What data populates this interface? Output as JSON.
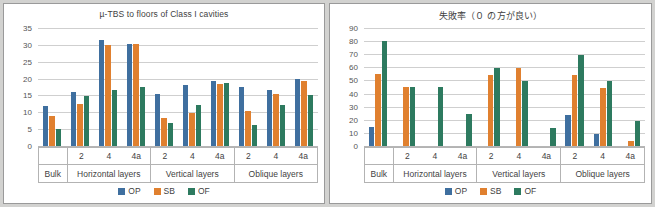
{
  "page": {
    "background": "#d2d2d0",
    "panel_background": "#ffffff"
  },
  "colors": {
    "op": "#3f6f9f",
    "sb": "#e0802f",
    "of": "#2d7a5f",
    "grid": "#cfcfcf",
    "text": "#3f3f3f"
  },
  "legend": {
    "position": "bottom-center",
    "entries": [
      {
        "label": "OP",
        "color": "#3f6f9f"
      },
      {
        "label": "SB",
        "color": "#e0802f"
      },
      {
        "label": "OF",
        "color": "#2d7a5f"
      }
    ]
  },
  "axis_groups": [
    {
      "group": "Bulk",
      "subs": [
        ""
      ]
    },
    {
      "group": "Horizontal layers",
      "subs": [
        "2",
        "4",
        "4a"
      ]
    },
    {
      "group": "Vertical layers",
      "subs": [
        "2",
        "4",
        "4a"
      ]
    },
    {
      "group": "Oblique layers",
      "subs": [
        "2",
        "4",
        "4a"
      ]
    }
  ],
  "chart_data": [
    {
      "id": "left",
      "type": "bar",
      "title": "µ-TBS to floors of Class I cavities",
      "xlabel": "",
      "ylabel": "",
      "ylim": [
        0,
        35
      ],
      "yticks": [
        0,
        5,
        10,
        15,
        20,
        25,
        30,
        35
      ],
      "ytick_labels": [
        "0",
        "5",
        "10",
        "15",
        "20",
        "25",
        "30",
        "35"
      ],
      "grid": true,
      "legend": [
        "OP",
        "SB",
        "OF"
      ],
      "categories": [
        "Bulk",
        "Horizontal layers 2",
        "Horizontal layers 4",
        "Horizontal layers 4a",
        "Vertical layers 2",
        "Vertical layers 4",
        "Vertical layers 4a",
        "Oblique layers 2",
        "Oblique layers 4",
        "Oblique layers 4a"
      ],
      "series": [
        {
          "name": "OP",
          "color": "#3f6f9f",
          "values": [
            11.8,
            16.0,
            31.5,
            30.2,
            15.5,
            18.0,
            19.2,
            17.4,
            16.6,
            19.8
          ]
        },
        {
          "name": "SB",
          "color": "#e0802f",
          "values": [
            8.8,
            12.5,
            29.9,
            30.4,
            8.4,
            9.9,
            18.4,
            10.5,
            15.3,
            19.3
          ]
        },
        {
          "name": "OF",
          "color": "#2d7a5f",
          "values": [
            5.0,
            14.9,
            16.7,
            17.4,
            6.8,
            12.2,
            18.7,
            6.3,
            12.2,
            15.2
          ]
        }
      ]
    },
    {
      "id": "right",
      "type": "bar",
      "title": "失敗率（０ の方が良い）",
      "xlabel": "",
      "ylabel": "",
      "ylim": [
        0,
        90
      ],
      "yticks": [
        0,
        10,
        20,
        30,
        40,
        50,
        60,
        70,
        80,
        90
      ],
      "ytick_labels": [
        "0",
        "10",
        "20",
        "30",
        "40",
        "50",
        "60",
        "70",
        "80",
        "90"
      ],
      "grid": true,
      "legend": [
        "OP",
        "SB",
        "OF"
      ],
      "categories": [
        "Bulk",
        "Horizontal layers 2",
        "Horizontal layers 4",
        "Horizontal layers 4a",
        "Vertical layers 2",
        "Vertical layers 4",
        "Vertical layers 4a",
        "Oblique layers 2",
        "Oblique layers 4",
        "Oblique layers 4a"
      ],
      "series": [
        {
          "name": "OP",
          "color": "#3f6f9f",
          "values": [
            14.5,
            0,
            0,
            0,
            0,
            0,
            0,
            24.0,
            9.3,
            0
          ]
        },
        {
          "name": "SB",
          "color": "#e0802f",
          "values": [
            55.0,
            44.8,
            0,
            0,
            54.5,
            59.5,
            0,
            54.5,
            44.2,
            4.2
          ]
        },
        {
          "name": "OF",
          "color": "#2d7a5f",
          "values": [
            80.0,
            44.8,
            44.8,
            24.2,
            59.7,
            49.7,
            14.0,
            69.5,
            49.5,
            19.2
          ]
        }
      ]
    }
  ]
}
